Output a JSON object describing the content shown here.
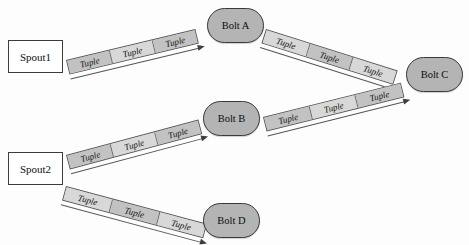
{
  "diagram": {
    "type": "stream-topology",
    "top_clipped_text": "··· ···· ·· ···· ·· ····· ····",
    "nodes": [
      {
        "id": "spout1",
        "label": "Spout1",
        "shape": "rectangle",
        "x": 8,
        "y": 40,
        "w": 55,
        "h": 33
      },
      {
        "id": "spout2",
        "label": "Spout2",
        "shape": "rectangle",
        "x": 8,
        "y": 152,
        "w": 55,
        "h": 33
      },
      {
        "id": "boltA",
        "label": "Bolt A",
        "shape": "stadium",
        "x": 207,
        "y": 8,
        "w": 57,
        "h": 35
      },
      {
        "id": "boltB",
        "label": "Bolt B",
        "shape": "stadium",
        "x": 203,
        "y": 101,
        "w": 57,
        "h": 35
      },
      {
        "id": "boltC",
        "label": "Bolt C",
        "shape": "stadium",
        "x": 406,
        "y": 57,
        "w": 57,
        "h": 35
      },
      {
        "id": "boltD",
        "label": "Bolt D",
        "shape": "stadium",
        "x": 203,
        "y": 203,
        "w": 57,
        "h": 35
      }
    ],
    "edges": [
      {
        "id": "e1",
        "from": "spout1",
        "to": "boltA",
        "x": 66,
        "y": 60,
        "length": 133,
        "angle": -13.5,
        "segments": [
          "Tuple",
          "Tuple",
          "Tuple"
        ]
      },
      {
        "id": "e2",
        "from": "boltA",
        "to": "boltC",
        "x": 266,
        "y": 29,
        "length": 138,
        "angle": 17.5,
        "segments": [
          "Tuple",
          "Tuple",
          "Tuple"
        ]
      },
      {
        "id": "e3",
        "from": "spout2",
        "to": "boltB",
        "x": 66,
        "y": 155,
        "length": 137,
        "angle": -15.0,
        "segments": [
          "Tuple",
          "Tuple",
          "Tuple"
        ]
      },
      {
        "id": "e4",
        "from": "boltB",
        "to": "boltC",
        "x": 263,
        "y": 117,
        "length": 142,
        "angle": -14.0,
        "segments": [
          "Tuple",
          "Tuple",
          "Tuple"
        ]
      },
      {
        "id": "e5",
        "from": "spout2",
        "to": "boltD",
        "x": 66,
        "y": 186,
        "length": 146,
        "angle": 15.0,
        "segments": [
          "Tuple",
          "Tuple",
          "Tuple"
        ]
      }
    ],
    "colors": {
      "node_fill": "#b4b4b4",
      "node_stroke": "#3a3a3a",
      "spout_fill": "#ffffff",
      "spout_stroke": "#3c3c3c",
      "tuple_fill_dark": "#c2c2c2",
      "tuple_fill_light": "#d8d8d8",
      "tuple_stroke": "#5d5d5d",
      "arrow": "#3d3d3d",
      "background": "#fdfdfd"
    }
  }
}
